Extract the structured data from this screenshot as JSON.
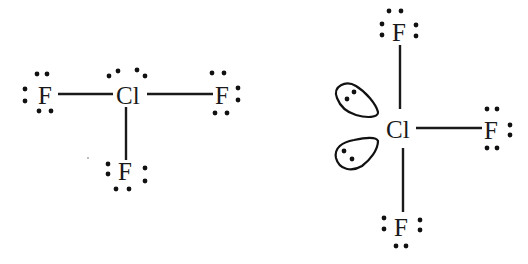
{
  "diagram": {
    "type": "lewis-structures",
    "molecule": "ClF3",
    "structures": [
      {
        "id": "left",
        "description": "Lewis dot structure, planar T arrangement",
        "central_atom": {
          "symbol": "Cl",
          "lone_pair_dots": 4
        },
        "ligands": [
          {
            "symbol": "F",
            "position": "left",
            "lone_pairs": 3
          },
          {
            "symbol": "F",
            "position": "right",
            "lone_pairs": 3
          },
          {
            "symbol": "F",
            "position": "bottom",
            "lone_pairs": 3
          }
        ]
      },
      {
        "id": "right",
        "description": "T-shaped geometry with two lone-pair lobes on Cl",
        "central_atom": {
          "symbol": "Cl",
          "lone_pair_lobes": 2
        },
        "ligands": [
          {
            "symbol": "F",
            "position": "top",
            "lone_pairs": 3
          },
          {
            "symbol": "F",
            "position": "right",
            "lone_pairs": 3
          },
          {
            "symbol": "F",
            "position": "bottom",
            "lone_pairs": 3
          }
        ]
      }
    ],
    "labels": {
      "left_F_left": "F",
      "left_Cl": "Cl",
      "left_F_right": "F",
      "left_F_bottom": "F",
      "right_F_top": "F",
      "right_Cl": "Cl",
      "right_F_right": "F",
      "right_F_bottom": "F"
    },
    "colors": {
      "ink": "#1a1a1a",
      "background": "#ffffff"
    }
  }
}
